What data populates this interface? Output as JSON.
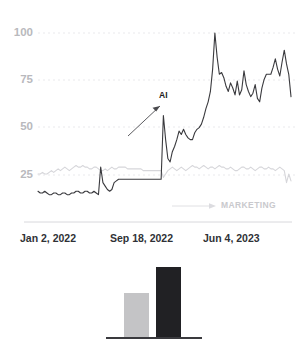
{
  "chart_data": {
    "type": "line",
    "title": "",
    "xlabel": "",
    "ylabel": "",
    "ylim": [
      0,
      100
    ],
    "yticks": [
      25,
      50,
      75,
      100
    ],
    "ytick_labels": [
      "25",
      "50",
      "75",
      "100"
    ],
    "grid": true,
    "gridstyle": "dotted",
    "legend_position": "inline-annotation",
    "xticks": [
      0,
      0.5,
      0.8
    ],
    "xtick_labels": [
      "Jan 2, 2022",
      "Sep 18, 2022",
      "Jun 4, 2023"
    ],
    "annotations": [
      {
        "text": "AI",
        "color": "#1c1c1e",
        "arrow": "up-right"
      },
      {
        "text": "MARKETING",
        "color": "#c9c9cd",
        "arrow": "right"
      }
    ],
    "series": [
      {
        "name": "AI",
        "color": "#3a3a3e",
        "values": [
          8,
          7,
          7,
          8,
          7,
          6,
          6,
          7,
          7,
          6,
          6,
          7,
          7,
          6,
          6,
          7,
          7,
          8,
          8,
          7,
          7,
          8,
          8,
          7,
          7,
          8,
          7,
          6,
          22,
          13,
          11,
          9,
          8,
          9,
          13,
          14,
          15,
          15,
          15,
          15,
          15,
          15,
          15,
          15,
          15,
          15,
          15,
          15,
          15,
          15,
          15,
          15,
          15,
          15,
          15,
          15,
          52,
          38,
          27,
          25,
          31,
          34,
          38,
          43,
          41,
          44,
          41,
          39,
          38,
          38,
          42,
          44,
          45,
          47,
          51,
          56,
          60,
          66,
          79,
          100,
          86,
          76,
          77,
          74,
          69,
          66,
          71,
          68,
          64,
          72,
          64,
          67,
          78,
          70,
          66,
          63,
          65,
          70,
          62,
          60,
          68,
          73,
          76,
          76,
          76,
          80,
          85,
          79,
          75,
          83,
          90,
          82,
          76,
          63
        ]
      },
      {
        "name": "MARKETING",
        "color": "#d6d6da",
        "values": [
          18,
          18,
          19,
          18,
          18,
          19,
          20,
          19,
          20,
          21,
          20,
          21,
          22,
          21,
          20,
          21,
          22,
          23,
          22,
          22,
          23,
          22,
          22,
          21,
          21,
          22,
          22,
          21,
          20,
          20,
          21,
          20,
          21,
          22,
          21,
          21,
          22,
          22,
          22,
          22,
          21,
          21,
          21,
          21,
          21,
          21,
          21,
          20,
          20,
          20,
          20,
          20,
          20,
          20,
          20,
          20,
          16,
          18,
          20,
          21,
          22,
          21,
          20,
          21,
          22,
          21,
          20,
          21,
          22,
          23,
          22,
          22,
          21,
          22,
          23,
          22,
          21,
          22,
          22,
          21,
          22,
          23,
          22,
          22,
          21,
          21,
          22,
          21,
          20,
          20,
          21,
          22,
          22,
          21,
          21,
          22,
          21,
          20,
          21,
          22,
          22,
          21,
          21,
          22,
          21,
          21,
          20,
          21,
          22,
          21,
          20,
          13,
          18,
          14
        ]
      }
    ]
  },
  "bar_chart": {
    "type": "bar",
    "categories": [
      "",
      ""
    ],
    "values": [
      44,
      70
    ],
    "colors": [
      "#c4c4c6",
      "#212124"
    ],
    "baseline_color": "#3a3a3e",
    "title": "",
    "xlabel": "",
    "ylabel": "",
    "ylim": [
      0,
      100
    ]
  }
}
